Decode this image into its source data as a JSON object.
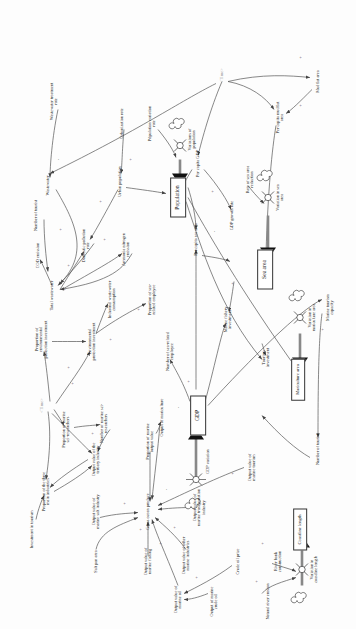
{
  "figure": {
    "type": "causal-loop-stock-flow-diagram",
    "orientation": "rotated-90-ccw",
    "background_color": "#fdfdfd",
    "line_color": "#555555",
    "text_color": "#1c1c1c",
    "time_color": "#9a9a9a"
  },
  "stocks": [
    {
      "id": "gdp",
      "label": "GDP",
      "x": 214,
      "y": 198
    },
    {
      "id": "population",
      "label": "Population",
      "x": 432,
      "y": 178
    },
    {
      "id": "sea_area",
      "label": "Sea area",
      "x": 360,
      "y": 265
    },
    {
      "id": "mariculture",
      "label": "Mariculture area",
      "x": 250,
      "y": 298
    },
    {
      "id": "coastline",
      "label": "Coastline length",
      "x": 100,
      "y": 300
    }
  ],
  "flows": [
    {
      "id": "gdp_variation",
      "label": "GDP variation",
      "x": 168,
      "y": 196
    },
    {
      "id": "variations_population",
      "label": "Variations of population",
      "x": 490,
      "y": 180
    },
    {
      "id": "variation_sea_area",
      "label": "Variation in sea area",
      "x": 432,
      "y": 268
    },
    {
      "id": "variation_mariculture",
      "label": "Variation in mariculture area",
      "x": 312,
      "y": 300
    },
    {
      "id": "variation_coastline",
      "label": "Variation in coastline length",
      "x": 60,
      "y": 302
    }
  ],
  "variables": [
    {
      "id": "gross_ocean_produce",
      "label": "Gross ocean produce",
      "x": 118,
      "y": 148
    },
    {
      "id": "output_marine_salt",
      "label": "Output value of marine salt industry",
      "x": 118,
      "y": 96
    },
    {
      "id": "salt_pan_area",
      "label": "Salt pan area",
      "x": 68,
      "y": 96
    },
    {
      "id": "output_marine_fishing",
      "label": "Output value of marine fishing",
      "x": 68,
      "y": 148
    },
    {
      "id": "output_marine_oil",
      "label": "Output value of marine oil",
      "x": 30,
      "y": 178
    },
    {
      "id": "output_other_marine",
      "label": "Output value of other marine industries",
      "x": 74,
      "y": 186
    },
    {
      "id": "output_marine_transport",
      "label": "Output value of marine transportation industry",
      "x": 122,
      "y": 200
    },
    {
      "id": "output_crude_oil",
      "label": "Output of marine crude oil",
      "x": 28,
      "y": 214
    },
    {
      "id": "crude_oil_price",
      "label": "Crude oil price",
      "x": 68,
      "y": 238
    },
    {
      "id": "river_bank_construction",
      "label": "River bank construction",
      "x": 68,
      "y": 278
    },
    {
      "id": "natural_river_erosion",
      "label": "Natural river erosion",
      "x": 28,
      "y": 268
    },
    {
      "id": "output_marine_tourism",
      "label": "Output value of marine tourism",
      "x": 162,
      "y": 252
    },
    {
      "id": "proportion_three_industries",
      "label": "Proportion of the three main industries",
      "x": 138,
      "y": 46
    },
    {
      "id": "investment_tourism",
      "label": "Investment in tourism",
      "x": 100,
      "y": 32
    },
    {
      "id": "output_tertiary",
      "label": "Output value of the tertiary industry",
      "x": 170,
      "y": 96
    },
    {
      "id": "proportion_marine_sci",
      "label": "Proportion of marine sci-researchers",
      "x": 200,
      "y": 66
    },
    {
      "id": "number_marine_sci",
      "label": "Number of marine sci-researchers",
      "x": 206,
      "y": 104
    },
    {
      "id": "time_top",
      "label": "<Time>",
      "x": 224,
      "y": 42
    },
    {
      "id": "proportion_env_protection",
      "label": "Proportion of environmental protection investment",
      "x": 290,
      "y": 42
    },
    {
      "id": "env_protection_investment",
      "label": "Environmental protection investment",
      "x": 288,
      "y": 92
    },
    {
      "id": "total_wastewater",
      "label": "Total wastewater",
      "x": 334,
      "y": 52
    },
    {
      "id": "cod_emission",
      "label": "COD emission",
      "x": 374,
      "y": 38
    },
    {
      "id": "number_of_tourist_left",
      "label": "Number of tourist",
      "x": 414,
      "y": 36
    },
    {
      "id": "wastewater",
      "label": "Wastewater",
      "x": 444,
      "y": 48
    },
    {
      "id": "domestic_pollution_rate",
      "label": "Domestic pollution rate",
      "x": 384,
      "y": 86
    },
    {
      "id": "ammonia_emission",
      "label": "Ammonia nitrogen emission",
      "x": 380,
      "y": 126
    },
    {
      "id": "industrial_wastewater",
      "label": "Industrial wastewater consumption",
      "x": 330,
      "y": 112
    },
    {
      "id": "proportion_sea_employee",
      "label": "Proportion of sea-related employee",
      "x": 330,
      "y": 152
    },
    {
      "id": "number_sea_employee",
      "label": "Number of sea-related employee",
      "x": 278,
      "y": 170
    },
    {
      "id": "urban_population",
      "label": "Urban population",
      "x": 448,
      "y": 120
    },
    {
      "id": "urbanization_rate",
      "label": "Urbanization rate",
      "x": 506,
      "y": 122
    },
    {
      "id": "wastewater_treatment_rate",
      "label": "Wastewater treatment rate",
      "x": 528,
      "y": 54
    },
    {
      "id": "population_variation_rate",
      "label": "Population variation rate",
      "x": 506,
      "y": 152
    },
    {
      "id": "per_capita_gdp",
      "label": "Per capita GDP",
      "x": 466,
      "y": 198
    },
    {
      "id": "gdp_growth_rate",
      "label": "GDP growth rate",
      "x": 414,
      "y": 232
    },
    {
      "id": "per_capita_sea_area",
      "label": "Per capita sea area",
      "x": 390,
      "y": 196
    },
    {
      "id": "rate_sea_area_reduction",
      "label": "Rate of sea area reduction",
      "x": 450,
      "y": 250
    },
    {
      "id": "marine_fishery_investment",
      "label": "Marine fishery investment",
      "x": 310,
      "y": 228
    },
    {
      "id": "tourism_investment",
      "label": "Tourism investment",
      "x": 272,
      "y": 266
    },
    {
      "id": "marine_tourism_capacity",
      "label": "Marine tourism capacity",
      "x": 322,
      "y": 330
    },
    {
      "id": "number_of_tourist_right",
      "label": "Number of tourist",
      "x": 180,
      "y": 318
    },
    {
      "id": "per_capita_mudflat_area",
      "label": "Per capita mudflat area",
      "x": 512,
      "y": 280
    },
    {
      "id": "mudflat_area",
      "label": "Mudflat area",
      "x": 548,
      "y": 318
    },
    {
      "id": "time_bottom",
      "label": "<Time>",
      "x": 554,
      "y": 222
    },
    {
      "id": "proportion_marine_output",
      "label": "Proportion of marine output value",
      "x": 188,
      "y": 150
    },
    {
      "id": "output_mariculture",
      "label": "Output of mariculture",
      "x": 212,
      "y": 162
    }
  ],
  "signs": [
    {
      "s": "+",
      "x": 100,
      "y": 140
    },
    {
      "s": "+",
      "x": 126,
      "y": 124
    },
    {
      "s": "+",
      "x": 86,
      "y": 160
    },
    {
      "s": "+",
      "x": 102,
      "y": 174
    },
    {
      "s": "+",
      "x": 52,
      "y": 196
    },
    {
      "s": "-",
      "x": 140,
      "y": 166
    },
    {
      "s": "+",
      "x": 48,
      "y": 256
    },
    {
      "s": "+",
      "x": 86,
      "y": 262
    },
    {
      "s": "+",
      "x": 156,
      "y": 232
    },
    {
      "s": "+",
      "x": 196,
      "y": 92
    },
    {
      "s": "+",
      "x": 246,
      "y": 72
    },
    {
      "s": "+",
      "x": 262,
      "y": 68
    },
    {
      "s": "+",
      "x": 340,
      "y": 64
    },
    {
      "s": "+",
      "x": 364,
      "y": 68
    },
    {
      "s": "+",
      "x": 390,
      "y": 104
    },
    {
      "s": "+",
      "x": 400,
      "y": 60
    },
    {
      "s": "+",
      "x": 428,
      "y": 100
    },
    {
      "s": "-",
      "x": 470,
      "y": 58
    },
    {
      "s": "+",
      "x": 470,
      "y": 130
    },
    {
      "s": "-",
      "x": 492,
      "y": 148
    },
    {
      "s": "+",
      "x": 438,
      "y": 212
    },
    {
      "s": "-",
      "x": 398,
      "y": 214
    },
    {
      "s": "+",
      "x": 346,
      "y": 232
    },
    {
      "s": "+",
      "x": 300,
      "y": 322
    },
    {
      "s": "+",
      "x": 524,
      "y": 300
    },
    {
      "s": "+",
      "x": 572,
      "y": 300
    },
    {
      "s": "+",
      "x": 248,
      "y": 188
    },
    {
      "s": "-",
      "x": 222,
      "y": 178
    },
    {
      "s": "+",
      "x": 290,
      "y": 110
    },
    {
      "s": "+",
      "x": 320,
      "y": 138
    }
  ]
}
